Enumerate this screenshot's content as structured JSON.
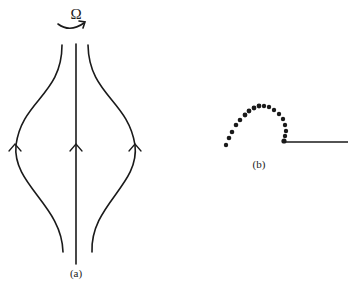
{
  "panel_a": {
    "label": "(a)",
    "rotation_symbol": "Ω",
    "streamlines": [
      "left-streamline",
      "axis-streamline",
      "right-streamline"
    ],
    "flow_direction": "upward"
  },
  "panel_b": {
    "label": "(b)",
    "dot_count": 18,
    "line": "horizontal"
  },
  "colors": {
    "ink": "#1a1a1a",
    "background": "#ffffff"
  }
}
